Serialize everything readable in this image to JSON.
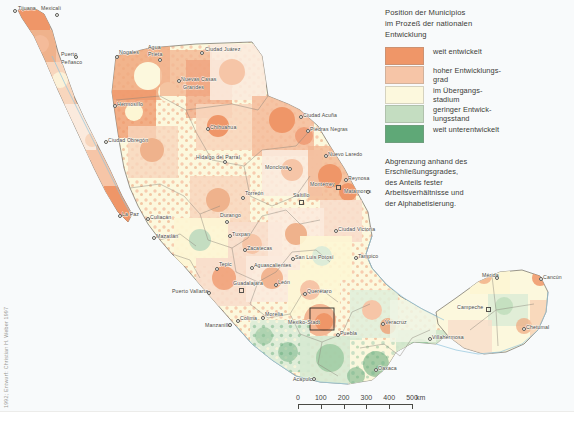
{
  "legend": {
    "title": "Position der Municipios im Prozeß der nationalen Entwicklung",
    "title_lines": [
      "Position der Municipios",
      "im Prozeß der nationalen",
      "Entwicklung"
    ],
    "items": [
      {
        "label": "weit entwickelt",
        "color": "#ef9668"
      },
      {
        "label": "hoher Entwicklungs-\ngrad",
        "color": "#f6c5a7"
      },
      {
        "label": "im Übergangs-\nstadium",
        "color": "#fcf8dd"
      },
      {
        "label": "geringer Entwick-\nlungsstand",
        "color": "#c4ddc1"
      },
      {
        "label": "weit unterentwickelt",
        "color": "#5fa877"
      }
    ],
    "note": "Abgrenzung anhand des Erschließungsgrades, des Anteils fester Arbeitsverhältnisse und der Alphabetisierung.",
    "note_lines": [
      "Abgrenzung anhand des",
      "Erschließungsgrades,",
      "des Anteils fester",
      "Arbeitsverhältnisse und",
      "der Alphabetisierung."
    ]
  },
  "scalebar": {
    "ticks": [
      "0",
      "100",
      "200",
      "300",
      "400",
      "500"
    ],
    "unit": "km"
  },
  "credit": "1992; Entwurf: Christian H. Weber 1997",
  "map": {
    "ocean_color": "#f3f8fa",
    "land_border_color": "#6e6a60",
    "state_border_color": "#8a857a",
    "coast_color": "#8fc4dc",
    "cities": [
      {
        "name": "Tijuana",
        "x": 18,
        "y": 6,
        "marker": "dot",
        "mx": 13,
        "my": 9
      },
      {
        "name": "Mexicali",
        "x": 41,
        "y": 6,
        "marker": "dot",
        "mx": 55,
        "my": 13
      },
      {
        "name": "Puerto",
        "x": 61,
        "y": 52,
        "marker": "none",
        "mx": 0,
        "my": 0
      },
      {
        "name": "Peñasco",
        "x": 61,
        "y": 60,
        "marker": "dot",
        "mx": 74,
        "my": 55
      },
      {
        "name": "Nogales",
        "x": 119,
        "y": 50,
        "marker": "dot",
        "mx": 115,
        "my": 55
      },
      {
        "name": "Agua",
        "x": 148,
        "y": 45,
        "marker": "none",
        "mx": 0,
        "my": 0
      },
      {
        "name": "Prieta",
        "x": 148,
        "y": 52,
        "marker": "dot",
        "mx": 158,
        "my": 58
      },
      {
        "name": "Ciudad Juárez",
        "x": 205,
        "y": 47,
        "marker": "dot",
        "mx": 200,
        "my": 51
      },
      {
        "name": "Nuevas Casas",
        "x": 181,
        "y": 77,
        "marker": "dot",
        "mx": 177,
        "my": 79
      },
      {
        "name": "Grandes",
        "x": 183,
        "y": 85,
        "marker": "none",
        "mx": 0,
        "my": 0
      },
      {
        "name": "Hermosillo",
        "x": 117,
        "y": 102,
        "marker": "dot",
        "mx": 113,
        "my": 104
      },
      {
        "name": "Chihuahua",
        "x": 210,
        "y": 125,
        "marker": "dot",
        "mx": 206,
        "my": 127
      },
      {
        "name": "Ciudad Acuña",
        "x": 303,
        "y": 113,
        "marker": "dot",
        "mx": 299,
        "my": 115
      },
      {
        "name": "Piedras Negras",
        "x": 310,
        "y": 127,
        "marker": "dot",
        "mx": 306,
        "my": 129
      },
      {
        "name": "Ciudad Obregón",
        "x": 108,
        "y": 138,
        "marker": "dot",
        "mx": 104,
        "my": 140
      },
      {
        "name": "Hidalgo del Parral",
        "x": 196,
        "y": 155,
        "marker": "dot",
        "mx": 223,
        "my": 160
      },
      {
        "name": "Nuevo Laredo",
        "x": 328,
        "y": 152,
        "marker": "dot",
        "mx": 324,
        "my": 154
      },
      {
        "name": "Monclova",
        "x": 265,
        "y": 165,
        "marker": "dot",
        "mx": 288,
        "my": 167
      },
      {
        "name": "Reynosa",
        "x": 348,
        "y": 176,
        "marker": "dot",
        "mx": 344,
        "my": 178
      },
      {
        "name": "Monterrey",
        "x": 310,
        "y": 182,
        "marker": "sq",
        "mx": 336,
        "my": 185
      },
      {
        "name": "Matamoros",
        "x": 344,
        "y": 189,
        "marker": "dot",
        "mx": 366,
        "my": 190
      },
      {
        "name": "Torreón",
        "x": 245,
        "y": 191,
        "marker": "dot",
        "mx": 241,
        "my": 196
      },
      {
        "name": "Saltillo",
        "x": 293,
        "y": 193,
        "marker": "sq",
        "mx": 299,
        "my": 200
      },
      {
        "name": "Durango",
        "x": 220,
        "y": 213,
        "marker": "dot",
        "mx": 225,
        "my": 220
      },
      {
        "name": "La Paz",
        "x": 122,
        "y": 212,
        "marker": "dot",
        "mx": 118,
        "my": 214
      },
      {
        "name": "Culiacán",
        "x": 150,
        "y": 215,
        "marker": "dot",
        "mx": 146,
        "my": 217
      },
      {
        "name": "Tuxpan",
        "x": 232,
        "y": 232,
        "marker": "dot",
        "mx": 228,
        "my": 234
      },
      {
        "name": "Mazatlán",
        "x": 156,
        "y": 234,
        "marker": "dot",
        "mx": 152,
        "my": 236
      },
      {
        "name": "Ciudad Victoria",
        "x": 338,
        "y": 227,
        "marker": "dot",
        "mx": 334,
        "my": 229
      },
      {
        "name": "Zacatecas",
        "x": 247,
        "y": 246,
        "marker": "dot",
        "mx": 243,
        "my": 248
      },
      {
        "name": "San Luis Potosí",
        "x": 295,
        "y": 255,
        "marker": "dot",
        "mx": 291,
        "my": 257
      },
      {
        "name": "Tampico",
        "x": 358,
        "y": 254,
        "marker": "dot",
        "mx": 354,
        "my": 256
      },
      {
        "name": "Tepic",
        "x": 219,
        "y": 262,
        "marker": "dot",
        "mx": 215,
        "my": 267
      },
      {
        "name": "Aguascalientes",
        "x": 254,
        "y": 263,
        "marker": "dot",
        "mx": 250,
        "my": 266
      },
      {
        "name": "Mérida",
        "x": 482,
        "y": 273,
        "marker": "dot",
        "mx": 495,
        "my": 276
      },
      {
        "name": "Cancún",
        "x": 543,
        "y": 275,
        "marker": "dot",
        "mx": 539,
        "my": 277
      },
      {
        "name": "León",
        "x": 278,
        "y": 280,
        "marker": "dot",
        "mx": 274,
        "my": 283
      },
      {
        "name": "Guadalajara",
        "x": 233,
        "y": 281,
        "marker": "sq",
        "mx": 239,
        "my": 288
      },
      {
        "name": "Querétaro",
        "x": 307,
        "y": 289,
        "marker": "dot",
        "mx": 303,
        "my": 292
      },
      {
        "name": "Puerto Vallarta",
        "x": 172,
        "y": 289,
        "marker": "dot",
        "mx": 207,
        "my": 291
      },
      {
        "name": "Campeche",
        "x": 457,
        "y": 305,
        "marker": "sq",
        "mx": 486,
        "my": 307
      },
      {
        "name": "Morelia",
        "x": 265,
        "y": 312,
        "marker": "dot",
        "mx": 261,
        "my": 316
      },
      {
        "name": "Manzanillo",
        "x": 205,
        "y": 323,
        "marker": "dot",
        "mx": 228,
        "my": 323
      },
      {
        "name": "Colima",
        "x": 240,
        "y": 316,
        "marker": "dot",
        "mx": 236,
        "my": 319
      },
      {
        "name": "Mexiko-Stadt",
        "x": 288,
        "y": 320,
        "marker": "none",
        "mx": 0,
        "my": 0
      },
      {
        "name": "Puebla",
        "x": 340,
        "y": 331,
        "marker": "dot",
        "mx": 336,
        "my": 333
      },
      {
        "name": "Veracruz",
        "x": 385,
        "y": 320,
        "marker": "dot",
        "mx": 381,
        "my": 322
      },
      {
        "name": "Villahermosa",
        "x": 432,
        "y": 335,
        "marker": "dot",
        "mx": 428,
        "my": 337
      },
      {
        "name": "Chetumal",
        "x": 526,
        "y": 325,
        "marker": "dot",
        "mx": 522,
        "my": 327
      },
      {
        "name": "Acapulco",
        "x": 293,
        "y": 377,
        "marker": "dot",
        "mx": 312,
        "my": 377
      },
      {
        "name": "Oaxaca",
        "x": 378,
        "y": 366,
        "marker": "dot",
        "mx": 374,
        "my": 368
      }
    ]
  }
}
